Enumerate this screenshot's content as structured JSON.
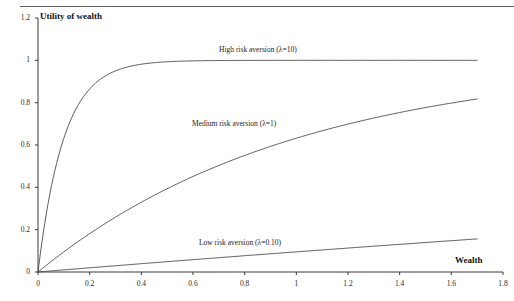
{
  "figure": {
    "y_axis_title": "Utility of wealth",
    "x_axis_title": "Wealth"
  },
  "chart_data": {
    "type": "line",
    "title": "",
    "xlabel": "Wealth",
    "ylabel": "Utility of wealth",
    "xlim": [
      0,
      1.8
    ],
    "ylim": [
      0,
      1.2
    ],
    "grid": false,
    "legend": "inline-annotations",
    "xticks": [
      "0",
      "0.2",
      "0.4",
      "0.6",
      "0.8",
      "1",
      "1.2",
      "1.4",
      "1.6",
      "1.8"
    ],
    "yticks": [
      "0",
      "0.2",
      "0.4",
      "0.6",
      "0.8",
      "1",
      "1.2"
    ],
    "x": [
      0,
      0.05,
      0.1,
      0.15,
      0.2,
      0.25,
      0.3,
      0.35,
      0.4,
      0.45,
      0.5,
      0.6,
      0.7,
      0.8,
      0.9,
      1.0,
      1.1,
      1.2,
      1.3,
      1.4,
      1.5,
      1.6,
      1.7
    ],
    "series": [
      {
        "name": "High risk aversion (λ=10)",
        "lambda": 10,
        "label": "High risk aversion (λ=10)",
        "values": [
          0,
          0.393,
          0.632,
          0.777,
          0.865,
          0.918,
          0.95,
          0.97,
          0.982,
          0.989,
          0.993,
          0.998,
          0.999,
          1.0,
          1.0,
          1.0,
          1.0,
          1.0,
          1.0,
          1.0,
          1.0,
          1.0,
          1.0
        ]
      },
      {
        "name": "Medium risk aversion (λ=1)",
        "lambda": 1,
        "label": "Medium risk aversion (λ=1)",
        "values": [
          0,
          0.049,
          0.095,
          0.139,
          0.181,
          0.221,
          0.259,
          0.295,
          0.33,
          0.362,
          0.393,
          0.451,
          0.503,
          0.551,
          0.593,
          0.632,
          0.667,
          0.699,
          0.727,
          0.753,
          0.777,
          0.798,
          0.817
        ]
      },
      {
        "name": "Low risk aversion (λ=0.10)",
        "lambda": 0.1,
        "label": "Low risk aversion (λ=0.10)",
        "values": [
          0,
          0.005,
          0.01,
          0.015,
          0.02,
          0.025,
          0.03,
          0.034,
          0.039,
          0.044,
          0.049,
          0.058,
          0.068,
          0.077,
          0.086,
          0.095,
          0.104,
          0.113,
          0.122,
          0.131,
          0.139,
          0.148,
          0.156
        ]
      }
    ],
    "equation": "U(w) = 1 - exp(-lambda * w)"
  }
}
